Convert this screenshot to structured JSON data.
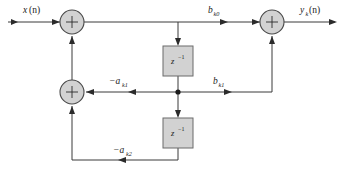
{
  "diagram": {
    "type": "signal-flow-graph",
    "canvas": {
      "width": 343,
      "height": 177
    },
    "colors": {
      "background": "#ffffff",
      "wire": "#3a3a3a",
      "node_fill": "#d2d2d2",
      "node_stroke": "#4a4a4a",
      "block_fill": "#d2d2d2",
      "block_stroke": "#6b6b6b",
      "text": "#1a1a1a",
      "junction": "#1c1c1c"
    },
    "labels": {
      "input": {
        "base": "x",
        "sub": "",
        "paren": "(n)",
        "full": "x(n)"
      },
      "output": {
        "base": "y",
        "sub": "k",
        "paren": "(n)",
        "full": "y_k(n)"
      },
      "feedforward_b0": {
        "base": "b",
        "sub": "k0",
        "full": "b_k0"
      },
      "feedforward_b1": {
        "base": "b",
        "sub": "k1",
        "full": "b_k1"
      },
      "feedback_a1": {
        "base": "−a",
        "sub": "k1",
        "full": "-a_k1"
      },
      "feedback_a2": {
        "base": "−a",
        "sub": "k2",
        "full": "-a_k2"
      }
    },
    "adders": [
      {
        "id": "adder-input",
        "label": "+",
        "cx": 72,
        "cy": 22,
        "r": 12
      },
      {
        "id": "adder-feedback",
        "label": "+",
        "cx": 72,
        "cy": 92,
        "r": 12
      },
      {
        "id": "adder-output",
        "label": "+",
        "cx": 272,
        "cy": 22,
        "r": 12
      }
    ],
    "delays": [
      {
        "id": "delay-upper",
        "base": "z",
        "exponent": "−1",
        "full": "z⁻¹",
        "x": 163,
        "y": 46,
        "w": 30,
        "h": 30
      },
      {
        "id": "delay-lower",
        "base": "z",
        "exponent": "−1",
        "full": "z⁻¹",
        "x": 163,
        "y": 118,
        "w": 30,
        "h": 30
      }
    ],
    "junctions": [
      {
        "id": "tap-junction",
        "cx": 178,
        "cy": 92,
        "r": 2.6
      }
    ]
  }
}
